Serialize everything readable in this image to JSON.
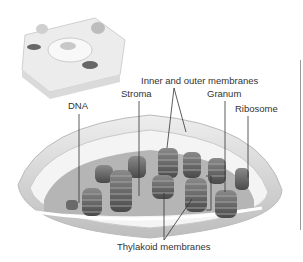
{
  "diagram": {
    "inset": "plant cell",
    "labels": {
      "dna": "DNA",
      "stroma": "Stroma",
      "membranes": "Inner and outer membranes",
      "granum": "Granum",
      "ribosome": "Ribosome",
      "thylakoid": "Thylakoid membranes"
    },
    "colors": {
      "outer": "#e4e4e4",
      "inner": "#c8c8c8",
      "stack": "#5a5a5a",
      "stack_light": "#9a9a9a",
      "leader": "#333333"
    }
  }
}
